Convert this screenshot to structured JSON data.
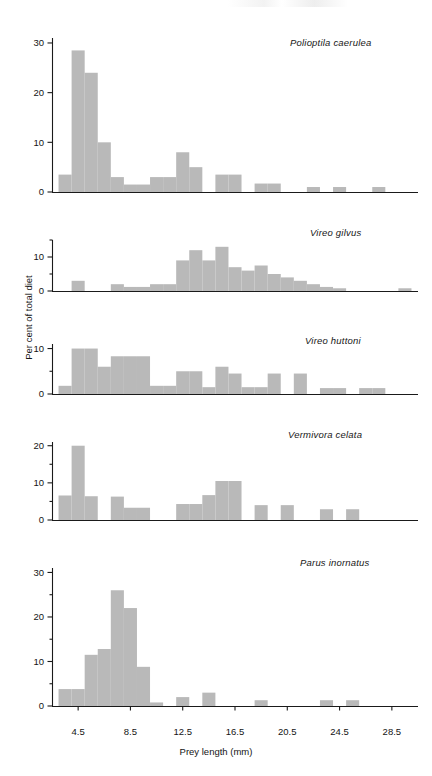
{
  "figure": {
    "xlabel": "Prey length (mm)",
    "ylabel": "Per cent of total diet",
    "xticks": [
      "4.5",
      "8.5",
      "12.5",
      "16.5",
      "20.5",
      "24.5",
      "28.5"
    ]
  },
  "panels": [
    {
      "species": "Polioptila caerulea",
      "yticks": [
        "0",
        "10",
        "20",
        "30"
      ]
    },
    {
      "species": "Vireo gilvus",
      "yticks": [
        "0",
        "10"
      ]
    },
    {
      "species": "Vireo huttoni",
      "yticks": [
        "0",
        "10"
      ]
    },
    {
      "species": "Vermivora celata",
      "yticks": [
        "0",
        "10",
        "20"
      ]
    },
    {
      "species": "Parus inornatus",
      "yticks": [
        "0",
        "10",
        "20",
        "30"
      ]
    }
  ],
  "chart_data": [
    {
      "type": "bar",
      "title": "Polioptila caerulea",
      "xlabel": "Prey length (mm)",
      "ylabel": "Per cent of total diet",
      "xlim": [
        2.5,
        30.5
      ],
      "ylim": [
        0,
        31
      ],
      "yticks": [
        0,
        10,
        20,
        30
      ],
      "xticks": [
        4.5,
        8.5,
        12.5,
        16.5,
        20.5,
        24.5,
        28.5
      ],
      "grid": false,
      "bin_width": 1,
      "x": [
        3.5,
        4.5,
        5.5,
        6.5,
        7.5,
        8.5,
        9.5,
        10.5,
        11.5,
        12.5,
        13.5,
        14.5,
        15.5,
        16.5,
        17.5,
        18.5,
        19.5,
        20.5,
        21.5,
        22.5,
        23.5,
        24.5,
        25.5,
        26.5,
        27.5,
        28.5,
        29.5
      ],
      "values": [
        3.5,
        28.5,
        24,
        10,
        3,
        1.5,
        1.5,
        3,
        3,
        8,
        5,
        0,
        3.5,
        3.5,
        0,
        1.7,
        1.7,
        0,
        0,
        1,
        0,
        1,
        0,
        0,
        1,
        0,
        0
      ]
    },
    {
      "type": "bar",
      "title": "Vireo gilvus",
      "xlabel": "Prey length (mm)",
      "ylabel": "Per cent of total diet",
      "xlim": [
        2.5,
        30.5
      ],
      "ylim": [
        0,
        15
      ],
      "yticks": [
        0,
        10
      ],
      "yminorticks": [
        5,
        15
      ],
      "xticks": [
        4.5,
        8.5,
        12.5,
        16.5,
        20.5,
        24.5,
        28.5
      ],
      "grid": false,
      "bin_width": 1,
      "x": [
        3.5,
        4.5,
        5.5,
        6.5,
        7.5,
        8.5,
        9.5,
        10.5,
        11.5,
        12.5,
        13.5,
        14.5,
        15.5,
        16.5,
        17.5,
        18.5,
        19.5,
        20.5,
        21.5,
        22.5,
        23.5,
        24.5,
        25.5,
        26.5,
        27.5,
        28.5,
        29.5
      ],
      "values": [
        0,
        3,
        0,
        0,
        2,
        1.2,
        1.2,
        2,
        2,
        9,
        12,
        9,
        13,
        7,
        6,
        7.5,
        5,
        4,
        3,
        2,
        1.2,
        0.8,
        0,
        0,
        0,
        0,
        0.8
      ]
    },
    {
      "type": "bar",
      "title": "Vireo huttoni",
      "xlabel": "Prey length (mm)",
      "ylabel": "Per cent of total diet",
      "xlim": [
        2.5,
        30.5
      ],
      "ylim": [
        0,
        11
      ],
      "yticks": [
        0,
        10
      ],
      "yminorticks": [
        5
      ],
      "xticks": [
        4.5,
        8.5,
        12.5,
        16.5,
        20.5,
        24.5,
        28.5
      ],
      "grid": false,
      "bin_width": 1,
      "x": [
        3.5,
        4.5,
        5.5,
        6.5,
        7.5,
        8.5,
        9.5,
        10.5,
        11.5,
        12.5,
        13.5,
        14.5,
        15.5,
        16.5,
        17.5,
        18.5,
        19.5,
        20.5,
        21.5,
        22.5,
        23.5,
        24.5,
        25.5,
        26.5,
        27.5,
        28.5,
        29.5
      ],
      "values": [
        1.8,
        10,
        10,
        6,
        8.3,
        8.3,
        8.3,
        1.8,
        1.8,
        5,
        5,
        1.5,
        6,
        4.5,
        1.5,
        1.5,
        4.5,
        0,
        4.5,
        0,
        1.3,
        1.3,
        0,
        1.3,
        1.3,
        0,
        0
      ]
    },
    {
      "type": "bar",
      "title": "Vermivora celata",
      "xlabel": "Prey length (mm)",
      "ylabel": "Per cent of total diet",
      "xlim": [
        2.5,
        30.5
      ],
      "ylim": [
        0,
        21
      ],
      "yticks": [
        0,
        10,
        20
      ],
      "yminorticks": [
        5,
        15
      ],
      "xticks": [
        4.5,
        8.5,
        12.5,
        16.5,
        20.5,
        24.5,
        28.5
      ],
      "grid": false,
      "bin_width": 1,
      "x": [
        3.5,
        4.5,
        5.5,
        6.5,
        7.5,
        8.5,
        9.5,
        10.5,
        11.5,
        12.5,
        13.5,
        14.5,
        15.5,
        16.5,
        17.5,
        18.5,
        19.5,
        20.5,
        21.5,
        22.5,
        23.5,
        24.5,
        25.5,
        26.5,
        27.5,
        28.5,
        29.5
      ],
      "values": [
        6.6,
        20,
        6.4,
        0,
        6.3,
        3.3,
        3.3,
        0,
        0,
        4.3,
        4.3,
        6.7,
        10.5,
        10.5,
        0,
        4,
        0,
        4,
        0,
        0,
        2.9,
        0,
        2.9,
        0,
        0,
        0,
        0
      ]
    },
    {
      "type": "bar",
      "title": "Parus inornatus",
      "xlabel": "Prey length (mm)",
      "ylabel": "Per cent of total diet",
      "xlim": [
        2.5,
        30.5
      ],
      "ylim": [
        0,
        31
      ],
      "yticks": [
        0,
        10,
        20,
        30
      ],
      "yminorticks": [
        5,
        15,
        25
      ],
      "xticks": [
        4.5,
        8.5,
        12.5,
        16.5,
        20.5,
        24.5,
        28.5
      ],
      "grid": false,
      "bin_width": 1,
      "x": [
        3.5,
        4.5,
        5.5,
        6.5,
        7.5,
        8.5,
        9.5,
        10.5,
        11.5,
        12.5,
        13.5,
        14.5,
        15.5,
        16.5,
        17.5,
        18.5,
        19.5,
        20.5,
        21.5,
        22.5,
        23.5,
        24.5,
        25.5,
        26.5,
        27.5,
        28.5,
        29.5
      ],
      "values": [
        3.8,
        3.8,
        11.5,
        12.8,
        26,
        22,
        8.8,
        0.8,
        0,
        2,
        0,
        3,
        0,
        0,
        0,
        1.3,
        0,
        0,
        0,
        0,
        1.3,
        0,
        1.3,
        0,
        0,
        0,
        0
      ]
    }
  ]
}
